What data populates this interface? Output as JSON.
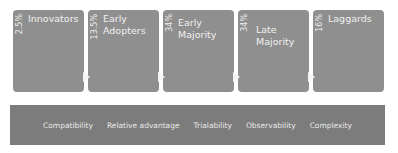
{
  "stages": [
    {
      "pct": "2.5%",
      "label": "Innovators"
    },
    {
      "pct": "13.5%",
      "label": "Early Adopters"
    },
    {
      "pct": "34%",
      "label": "Early Majority"
    },
    {
      "pct": "34%",
      "label": "Late Majority"
    },
    {
      "pct": "16%",
      "label": "Laggards"
    }
  ],
  "attributes": [
    "Compatibility",
    "Relative advantage",
    "Trialability",
    "Observability",
    "Complexity"
  ],
  "colors": {
    "box": "#8f8f8f",
    "bar": "#7c7c7c",
    "text": "#f0f0f0"
  }
}
